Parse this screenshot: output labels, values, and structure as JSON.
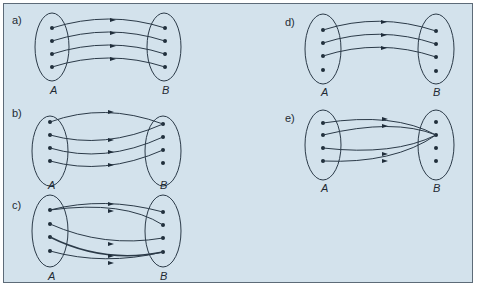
{
  "diagrams": [
    {
      "id": "a",
      "label": "a)",
      "set_a": "A",
      "set_b": "B",
      "mapping": [
        [
          0,
          0
        ],
        [
          1,
          1
        ],
        [
          2,
          2
        ],
        [
          3,
          3
        ]
      ],
      "description": "bijection"
    },
    {
      "id": "b",
      "label": "b)",
      "set_a": "A",
      "set_b": "B",
      "mapping": [
        [
          0,
          0
        ],
        [
          1,
          1
        ],
        [
          2,
          2
        ],
        [
          3,
          0
        ]
      ],
      "description": "one-to-one into"
    },
    {
      "id": "c",
      "label": "c)",
      "set_a": "A",
      "set_b": "B",
      "mapping": [
        [
          0,
          0
        ],
        [
          0,
          1
        ],
        [
          1,
          2
        ],
        [
          2,
          3
        ],
        [
          3,
          3
        ]
      ],
      "description": "not a function"
    },
    {
      "id": "d",
      "label": "d)",
      "set_a": "A",
      "set_b": "B",
      "mapping": [
        [
          0,
          0
        ],
        [
          1,
          1
        ],
        [
          2,
          2
        ]
      ],
      "description": "partial"
    },
    {
      "id": "e",
      "label": "e)",
      "set_a": "A",
      "set_b": "B",
      "mapping": [
        [
          0,
          1
        ],
        [
          1,
          1
        ],
        [
          2,
          1
        ],
        [
          3,
          1
        ]
      ],
      "description": "constant"
    }
  ],
  "colors": {
    "background": "#d3e2ec",
    "stroke": "#2b3a48",
    "dot": "#1f2d3a",
    "border": "#5d6b78"
  }
}
